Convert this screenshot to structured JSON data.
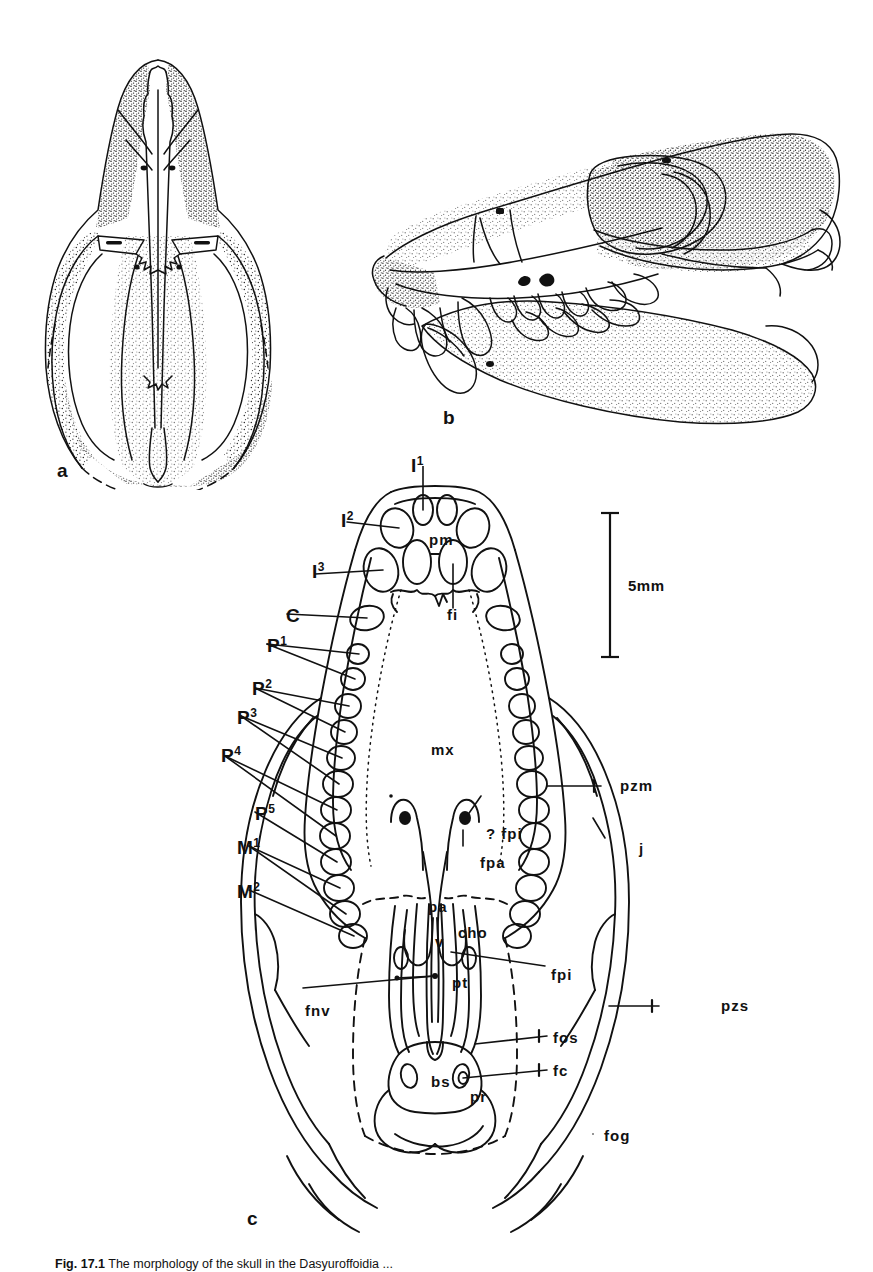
{
  "figure": {
    "panels": [
      {
        "id": "a",
        "label": "a",
        "view": "dorsal view of skull"
      },
      {
        "id": "b",
        "label": "b",
        "view": "lateral view of skull and mandible"
      },
      {
        "id": "c",
        "label": "c",
        "view": "ventral (palatal) view of skull"
      }
    ]
  },
  "scale_bar": {
    "label": "5mm",
    "value": 5,
    "unit": "mm"
  },
  "tooth_labels": [
    {
      "key": "i1",
      "base": "I",
      "sup": "1",
      "text": "I1"
    },
    {
      "key": "i2",
      "base": "I",
      "sup": "2",
      "text": "I2"
    },
    {
      "key": "i3",
      "base": "I",
      "sup": "3",
      "text": "I3"
    },
    {
      "key": "c",
      "base": "C",
      "sup": "",
      "text": "C"
    },
    {
      "key": "p1",
      "base": "P",
      "sup": "1",
      "text": "P1"
    },
    {
      "key": "p2",
      "base": "P",
      "sup": "2",
      "text": "P2"
    },
    {
      "key": "p3",
      "base": "P",
      "sup": "3",
      "text": "P3"
    },
    {
      "key": "p4",
      "base": "P",
      "sup": "4",
      "text": "P4"
    },
    {
      "key": "p5",
      "base": "P",
      "sup": "5",
      "text": "P5"
    },
    {
      "key": "m1",
      "base": "M",
      "sup": "1",
      "text": "M1"
    },
    {
      "key": "m2",
      "base": "M",
      "sup": "2",
      "text": "M2"
    }
  ],
  "anatomical_labels": [
    {
      "key": "pm",
      "text": "pm"
    },
    {
      "key": "fi",
      "text": "fi"
    },
    {
      "key": "mx",
      "text": "mx"
    },
    {
      "key": "pzm",
      "text": "pzm"
    },
    {
      "key": "qfpi",
      "text": "? fpi"
    },
    {
      "key": "fpa",
      "text": "fpa"
    },
    {
      "key": "j",
      "text": "j"
    },
    {
      "key": "pa",
      "text": "pa"
    },
    {
      "key": "cho",
      "text": "cho"
    },
    {
      "key": "v",
      "text": "v"
    },
    {
      "key": "pt",
      "text": "pt"
    },
    {
      "key": "fpi",
      "text": "fpi"
    },
    {
      "key": "fnv",
      "text": "fnv"
    },
    {
      "key": "fos",
      "text": "fos"
    },
    {
      "key": "fc",
      "text": "fc"
    },
    {
      "key": "bs",
      "text": "bs"
    },
    {
      "key": "pr",
      "text": "pr"
    },
    {
      "key": "pzs",
      "text": "pzs"
    },
    {
      "key": "fog",
      "text": "fog"
    }
  ],
  "caption": {
    "prefix": "Fig. 17.1",
    "text": "The morphology of the skull in the Dasyuroffoidia ..."
  },
  "colors": {
    "ink": "#111111",
    "paper": "#ffffff"
  }
}
